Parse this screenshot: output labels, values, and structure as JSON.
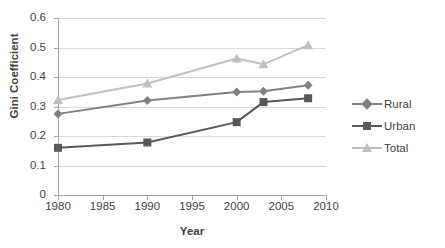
{
  "chart_data": {
    "type": "line",
    "title": "",
    "xlabel": "Year",
    "ylabel": "Gini Coefficient",
    "xlim": [
      1980,
      2010
    ],
    "ylim": [
      0,
      0.6
    ],
    "xticks": [
      1980,
      1985,
      1990,
      1995,
      2000,
      2005,
      2010
    ],
    "yticks": [
      0,
      0.1,
      0.2,
      0.3,
      0.4,
      0.5,
      0.6
    ],
    "xtick_labels": [
      "1980",
      "1985",
      "1990",
      "1995",
      "2000",
      "2005",
      "2010"
    ],
    "ytick_labels": [
      "0",
      "0.1",
      "0.2",
      "0.3",
      "0.4",
      "0.5",
      "0.6"
    ],
    "grid": "horizontal",
    "legend_position": "right",
    "x": [
      1980,
      1990,
      2000,
      2003,
      2008
    ],
    "series": [
      {
        "name": "Rural",
        "marker": "diamond",
        "color": "#808080",
        "values": [
          0.275,
          0.32,
          0.349,
          0.352,
          0.372
        ]
      },
      {
        "name": "Urban",
        "marker": "square",
        "color": "#595959",
        "values": [
          0.16,
          0.178,
          0.247,
          0.315,
          0.328
        ]
      },
      {
        "name": "Total",
        "marker": "triangle",
        "color": "#bfbfbf",
        "values": [
          0.322,
          0.378,
          0.463,
          0.443,
          0.508
        ]
      }
    ]
  },
  "legend": {
    "items": [
      {
        "label": "Rural"
      },
      {
        "label": "Urban"
      },
      {
        "label": "Total"
      }
    ]
  },
  "colors": {
    "rural": "#808080",
    "urban": "#595959",
    "total": "#bfbfbf",
    "grid": "#d9d9d9",
    "axis": "#a6a6a6",
    "text": "#3f3f3f",
    "background": "#ffffff"
  }
}
